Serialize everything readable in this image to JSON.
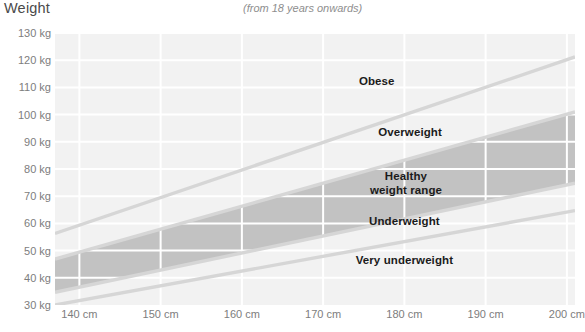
{
  "header": {
    "title": "Weight",
    "subtitle": "(from 18 years onwards)"
  },
  "chart_data": {
    "type": "area",
    "title": "Weight",
    "subtitle": "(from 18 years onwards)",
    "xlabel": "",
    "ylabel": "Weight",
    "xlim": [
      137,
      201
    ],
    "ylim": [
      30,
      130
    ],
    "xunit": "cm",
    "yunit": "kg",
    "grid": true,
    "legend": "none",
    "x_ticks": [
      140,
      150,
      160,
      170,
      180,
      190,
      200
    ],
    "x_tick_labels": [
      "140 cm",
      "150 cm",
      "160 cm",
      "170 cm",
      "180 cm",
      "190 cm",
      "200 cm"
    ],
    "y_ticks": [
      30,
      40,
      50,
      60,
      70,
      80,
      90,
      100,
      110,
      120,
      130
    ],
    "y_tick_labels": [
      "30 kg",
      "40 kg",
      "50 kg",
      "60 kg",
      "70 kg",
      "80 kg",
      "90 kg",
      "100 kg",
      "110 kg",
      "120 kg",
      "130 kg"
    ],
    "colors": {
      "plot_background": "#f2f2f2",
      "gridline": "#ffffff",
      "healthy_band": "#c2c2c2",
      "boundary_line": "#d6d6d6",
      "label_text": "#1b1b1b",
      "tick_text": "#7d7d7d",
      "title_text": "#4a4a4a",
      "subtitle_text": "#8e8e8e"
    },
    "boundaries": [
      {
        "name": "obese-threshold",
        "description": "BMI 30 boundary between Overweight and Obese",
        "bmi": 30,
        "points": [
          [
            137,
            56.3
          ],
          [
            201,
            121.2
          ]
        ]
      },
      {
        "name": "overweight-threshold",
        "description": "BMI 25 boundary, top of Healthy weight range",
        "bmi": 25,
        "points": [
          [
            137,
            46.9
          ],
          [
            201,
            101.0
          ]
        ]
      },
      {
        "name": "underweight-threshold",
        "description": "BMI 18.5 boundary, bottom of Healthy weight range",
        "bmi": 18.5,
        "points": [
          [
            137,
            34.7
          ],
          [
            201,
            74.8
          ]
        ]
      },
      {
        "name": "very-underweight-threshold",
        "description": "BMI 16 boundary between Underweight and Very underweight",
        "bmi": 16,
        "points": [
          [
            137,
            30.0
          ],
          [
            201,
            64.7
          ]
        ]
      }
    ],
    "bands": [
      {
        "name": "healthy-weight-range",
        "label": "Healthy\nweight range",
        "bmi_range": [
          18.5,
          25
        ],
        "fill": "#c2c2c2"
      }
    ],
    "zones": [
      {
        "name": "obese",
        "label": "Obese",
        "bmi_range": [
          30,
          null
        ],
        "label_x": 176.6,
        "label_y": 112.5
      },
      {
        "name": "overweight",
        "label": "Overweight",
        "bmi_range": [
          25,
          30
        ],
        "label_x": 180.7,
        "label_y": 93.5
      },
      {
        "name": "healthy-weight-range",
        "label": "Healthy\nweight range",
        "bmi_range": [
          18.5,
          25
        ],
        "label_x": 180.2,
        "label_y": 75.0
      },
      {
        "name": "underweight",
        "label": "Underweight",
        "bmi_range": [
          16,
          18.5
        ],
        "label_x": 180.0,
        "label_y": 61.0
      },
      {
        "name": "very-underweight",
        "label": "Very underweight",
        "bmi_range": [
          null,
          16
        ],
        "label_x": 180.0,
        "label_y": 46.5
      }
    ]
  }
}
